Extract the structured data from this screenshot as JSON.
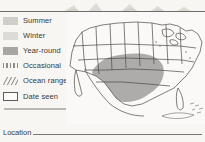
{
  "page": {
    "kind": "field-guide-range-map"
  },
  "legend": {
    "items": [
      {
        "label": "Summer",
        "swatch": "filled-swatch-light",
        "color": "#cfcecb"
      },
      {
        "label": "Winter",
        "swatch": "filled-swatch-lighter",
        "color": "#dcdbd8"
      },
      {
        "label": "Year-round",
        "swatch": "filled-swatch-dark",
        "color": "#a7a6a3"
      },
      {
        "label": "Occasional",
        "swatch": "dotted-swatch",
        "color": "#8d8c89"
      },
      {
        "label": "Ocean range",
        "swatch": "hatched-swatch",
        "color": "#8d8c89"
      },
      {
        "label": "Date seen",
        "swatch": "outlined-box-swatch",
        "color": "#5d5c59"
      }
    ]
  },
  "map": {
    "name": "north-america-range-map",
    "range_fill": "#a9a8a5",
    "outline_color": "#4a4945",
    "water_color": "#faf9f7",
    "range_description": "Shaded range across the south-central United States"
  },
  "location": {
    "label": "Location",
    "value": "",
    "placeholder": ""
  }
}
